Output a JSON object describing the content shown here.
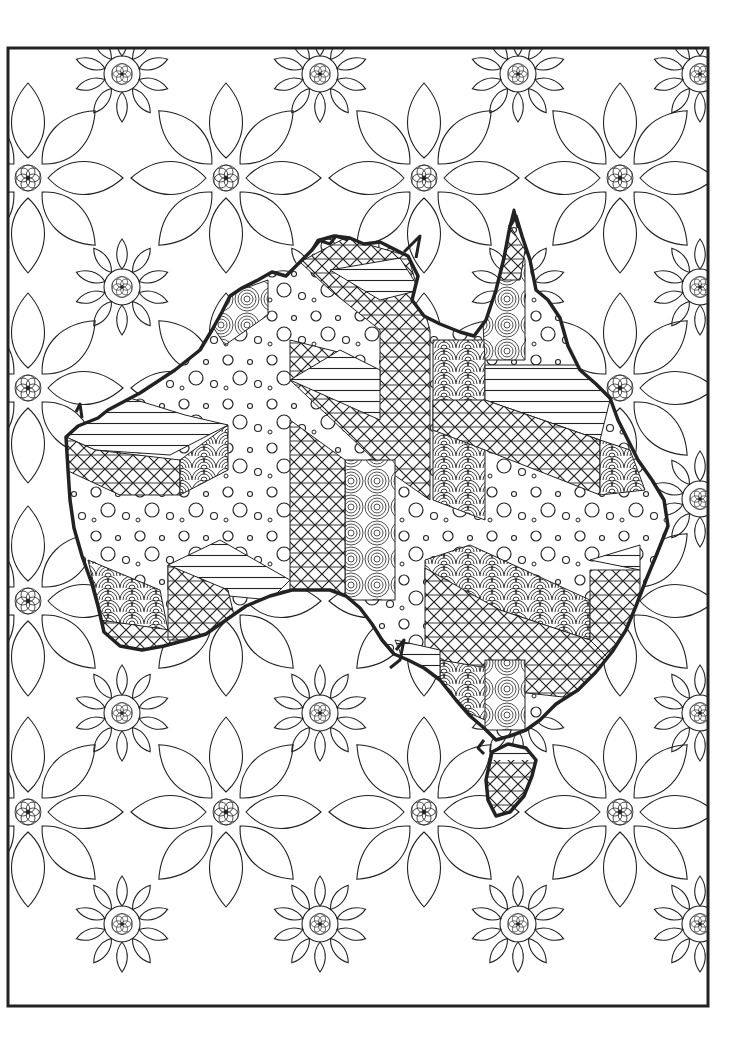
{
  "page": {
    "type": "coloring-page",
    "width": 752,
    "height": 1056,
    "background_color": "#ffffff",
    "line_color": "#222222"
  },
  "frame": {
    "x": 8,
    "y": 48,
    "width": 700,
    "height": 958,
    "stroke_width": 3
  },
  "background_pattern": {
    "motif": "flower",
    "description": "Repeating star flowers with rosette centres and teardrop petals",
    "flower_centers": [
      {
        "x": 122,
        "y": 74
      },
      {
        "x": 320,
        "y": 74
      },
      {
        "x": 518,
        "y": 74
      },
      {
        "x": 700,
        "y": 74
      },
      {
        "x": 28,
        "y": 178
      },
      {
        "x": 226,
        "y": 178
      },
      {
        "x": 424,
        "y": 178
      },
      {
        "x": 620,
        "y": 178
      },
      {
        "x": 122,
        "y": 287
      },
      {
        "x": 700,
        "y": 287
      },
      {
        "x": 28,
        "y": 388
      },
      {
        "x": 620,
        "y": 388
      },
      {
        "x": 28,
        "y": 601
      },
      {
        "x": 122,
        "y": 713
      },
      {
        "x": 320,
        "y": 713
      },
      {
        "x": 700,
        "y": 713
      },
      {
        "x": 28,
        "y": 812
      },
      {
        "x": 226,
        "y": 812
      },
      {
        "x": 424,
        "y": 812
      },
      {
        "x": 620,
        "y": 812
      },
      {
        "x": 122,
        "y": 924
      },
      {
        "x": 320,
        "y": 924
      },
      {
        "x": 518,
        "y": 924
      },
      {
        "x": 700,
        "y": 924
      }
    ]
  },
  "map": {
    "name": "Australia",
    "fill_patterns": [
      "crosshatch",
      "horizontal-stripes",
      "polka-dots",
      "scales",
      "concentric-circles"
    ],
    "regions": [
      {
        "name": "northwest-block",
        "pattern": "crosshatch"
      },
      {
        "name": "west-dots",
        "pattern": "polka-dots"
      },
      {
        "name": "top-end-crosshatch",
        "pattern": "crosshatch"
      },
      {
        "name": "cape-york",
        "pattern": "concentric-circles"
      },
      {
        "name": "queensland-stripes",
        "pattern": "horizontal-stripes"
      },
      {
        "name": "central-scales",
        "pattern": "scales"
      },
      {
        "name": "east-dots",
        "pattern": "polka-dots"
      },
      {
        "name": "southeast-crosshatch",
        "pattern": "crosshatch"
      },
      {
        "name": "southwest-scales",
        "pattern": "scales"
      },
      {
        "name": "tasmania",
        "pattern": "crosshatch"
      }
    ]
  }
}
